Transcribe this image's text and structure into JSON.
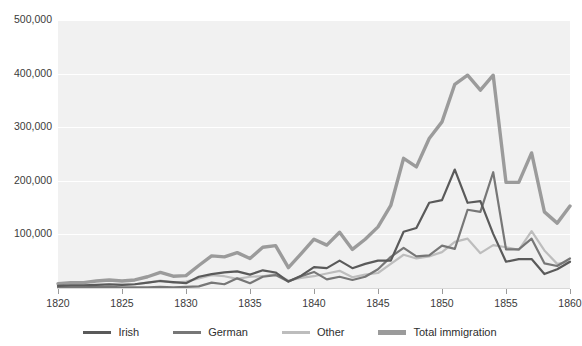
{
  "chart_data": {
    "type": "line",
    "title": "",
    "xlabel": "",
    "ylabel": "",
    "xlim": [
      1820,
      1860
    ],
    "ylim": [
      0,
      500000
    ],
    "grid": true,
    "legend_position": "bottom",
    "x_ticks": [
      "1820",
      "1825",
      "1830",
      "1835",
      "1840",
      "1845",
      "1850",
      "1855",
      "1860"
    ],
    "x_tick_values": [
      1820,
      1825,
      1830,
      1835,
      1840,
      1845,
      1850,
      1855,
      1860
    ],
    "y_ticks": [
      "100,000",
      "200,000",
      "300,000",
      "400,000",
      "500,000"
    ],
    "y_tick_values": [
      100000,
      200000,
      300000,
      400000,
      500000
    ],
    "x": [
      1820,
      1821,
      1822,
      1823,
      1824,
      1825,
      1826,
      1827,
      1828,
      1829,
      1830,
      1831,
      1832,
      1833,
      1834,
      1835,
      1836,
      1837,
      1838,
      1839,
      1840,
      1841,
      1842,
      1843,
      1844,
      1845,
      1846,
      1847,
      1848,
      1849,
      1850,
      1851,
      1852,
      1853,
      1854,
      1855,
      1856,
      1857,
      1858,
      1859,
      1860
    ],
    "series": [
      {
        "name": "Irish",
        "color": "#5a5a5a",
        "width": 2.2,
        "values": [
          4000,
          5000,
          5000,
          6000,
          7000,
          6000,
          7000,
          10000,
          13000,
          11000,
          9000,
          21000,
          26000,
          29000,
          31000,
          25000,
          33000,
          29000,
          12000,
          23000,
          39000,
          37000,
          51000,
          37000,
          45000,
          51000,
          51000,
          105000,
          112000,
          159000,
          164000,
          221000,
          159000,
          162000,
          101000,
          49000,
          54000,
          54000,
          26000,
          35000,
          49000
        ]
      },
      {
        "name": "German",
        "color": "#777777",
        "width": 2.2,
        "values": [
          1000,
          1000,
          1000,
          2000,
          2000,
          1000,
          1000,
          1000,
          2000,
          1000,
          2000,
          3000,
          10000,
          7000,
          18000,
          9000,
          21000,
          24000,
          12000,
          22000,
          30000,
          16000,
          21000,
          15000,
          21000,
          35000,
          58000,
          75000,
          59000,
          61000,
          79000,
          73000,
          146000,
          142000,
          216000,
          72000,
          72000,
          92000,
          46000,
          41000,
          55000
        ]
      },
      {
        "name": "Other",
        "color": "#bdbdbd",
        "width": 2.2,
        "values": [
          3000,
          4000,
          4000,
          5000,
          6000,
          6000,
          7000,
          10000,
          14000,
          10000,
          12000,
          18000,
          24000,
          22000,
          17000,
          21000,
          22000,
          26000,
          14000,
          19000,
          22000,
          27000,
          32000,
          20000,
          25000,
          28000,
          45000,
          62000,
          55000,
          59000,
          67000,
          86000,
          92000,
          65000,
          80000,
          76000,
          71000,
          106000,
          70000,
          45000,
          49000
        ]
      },
      {
        "name": "Total immigration",
        "color": "#9b9b9b",
        "width": 3.4,
        "values": [
          8000,
          10000,
          10000,
          13000,
          15000,
          13000,
          15000,
          21000,
          29000,
          22000,
          23000,
          42000,
          60000,
          58000,
          66000,
          55000,
          76000,
          79000,
          38000,
          64000,
          91000,
          80000,
          104000,
          72000,
          91000,
          114000,
          154000,
          242000,
          226000,
          279000,
          310000,
          380000,
          397000,
          369000,
          397000,
          197000,
          197000,
          252000,
          142000,
          121000,
          153000
        ]
      }
    ]
  },
  "axes": {
    "y_label_0": "100,000",
    "y_label_1": "200,000",
    "y_label_2": "300,000",
    "y_label_3": "400,000",
    "y_label_4": "500,000"
  },
  "legend": {
    "items": [
      {
        "label": "Irish",
        "color": "#5a5a5a",
        "thickness": 3
      },
      {
        "label": "German",
        "color": "#777777",
        "thickness": 3
      },
      {
        "label": "Other",
        "color": "#bdbdbd",
        "thickness": 3
      },
      {
        "label": "Total immigration",
        "color": "#9b9b9b",
        "thickness": 5
      }
    ]
  },
  "style": {
    "plot_background": "#f1f1f1",
    "gridline_color": "#ffffff",
    "page_background": "#ffffff",
    "text_color": "#3a3a3a"
  }
}
